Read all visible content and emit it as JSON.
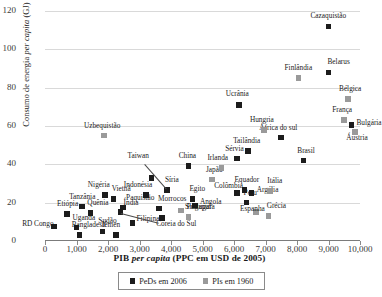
{
  "chart_data": {
    "type": "scatter",
    "title": "",
    "xlabel": "PIB per capita (PPC em USD de 2005)",
    "xlabel_parts": {
      "pre": "PIB ",
      "italic": "per capita",
      "post": " (PPC em USD de 2005)"
    },
    "ylabel": "Consumo de energia per capita (GJ)",
    "ylabel_parts": {
      "pre": "Consumo de energia ",
      "italic": "per capita",
      "post": " (GJ)"
    },
    "xlim": [
      0,
      10000
    ],
    "ylim": [
      0,
      120
    ],
    "xticks": [
      "0",
      "1,000",
      "2,000",
      "3,000",
      "4,000",
      "5,000",
      "6,000",
      "7,000",
      "8,000",
      "9,000",
      "10,000"
    ],
    "xtick_values": [
      0,
      1000,
      2000,
      3000,
      4000,
      5000,
      6000,
      7000,
      8000,
      9000,
      10000
    ],
    "yticks": [
      "0",
      "20",
      "40",
      "60",
      "80",
      "100",
      "120"
    ],
    "ytick_values": [
      0,
      20,
      40,
      60,
      80,
      100,
      120
    ],
    "grid": "horizontal",
    "legend_position": "bottom",
    "series": [
      {
        "name": "PeDs em 2006",
        "color": "#1c1c1c",
        "marker": "square",
        "points": [
          {
            "label": "RD Congo",
            "x": 290,
            "y": 7.5,
            "lx": -32,
            "ly": -3
          },
          {
            "label": "Etiópia",
            "x": 700,
            "y": 14.0,
            "lx": -10,
            "ly": -10
          },
          {
            "label": "Uganda",
            "x": 1000,
            "y": 7.0,
            "lx": -4,
            "ly": -10
          },
          {
            "label": "Bangladesh",
            "x": 1100,
            "y": 3.0,
            "lx": -8,
            "ly": -10
          },
          {
            "label": "Tanzânia",
            "x": 1180,
            "y": 18.0,
            "lx": -13,
            "ly": -10
          },
          {
            "label": "Quênia",
            "x": 1440,
            "y": 14.5,
            "lx": -3,
            "ly": -10
          },
          {
            "label": "Sudão",
            "x": 1820,
            "y": 5.0,
            "lx": -4,
            "ly": -10
          },
          {
            "label": "Nigéria",
            "x": 1900,
            "y": 24.0,
            "lx": -17,
            "ly": -10
          },
          {
            "label": "Vietnã",
            "x": 2180,
            "y": 22.0,
            "lx": -2,
            "ly": -10
          },
          {
            "label": "Iêmen",
            "x": 2250,
            "y": 3.0,
            "lx": -14,
            "ly": -10
          },
          {
            "label": "Índia",
            "x": 2400,
            "y": 15.0,
            "lx": 3,
            "ly": -9
          },
          {
            "label": "Paquistão",
            "x": 2480,
            "y": 17.5,
            "lx": 3,
            "ly": -9
          },
          {
            "label": "Filipinas",
            "x": 2780,
            "y": 9.5,
            "lx": 4,
            "ly": -4
          },
          {
            "label": "Indonésia",
            "x": 3200,
            "y": 24.0,
            "lx": -22,
            "ly": -10
          },
          {
            "label": "Taiwan",
            "x": 3380,
            "y": 33.0,
            "lx": -24,
            "ly": -22
          },
          {
            "label": "Morrocos",
            "x": 3620,
            "y": 17.0,
            "lx": -1,
            "ly": -9
          },
          {
            "label": "Coreia do Sul",
            "x": 3720,
            "y": 12.0,
            "lx": -6,
            "ly": 6
          },
          {
            "label": "Síria",
            "x": 3870,
            "y": 26.5,
            "lx": -2,
            "ly": -10
          },
          {
            "label": "China",
            "x": 4560,
            "y": 39.0,
            "lx": -10,
            "ly": -10
          },
          {
            "label": "Egito",
            "x": 4680,
            "y": 22.0,
            "lx": -3,
            "ly": -10
          },
          {
            "label": "Angola",
            "x": 4760,
            "y": 18.5,
            "lx": 5,
            "ly": -4
          },
          {
            "label": "Tailândia",
            "x": 6450,
            "y": 47.0,
            "lx": -15,
            "ly": -10
          },
          {
            "label": "Sérvia",
            "x": 6100,
            "y": 43.0,
            "lx": -12,
            "ly": -10
          },
          {
            "label": "Colômbia",
            "x": 6100,
            "y": 25.0,
            "lx": -23,
            "ly": -7
          },
          {
            "label": "Equador",
            "x": 6330,
            "y": 26.5,
            "lx": -10,
            "ly": -10
          },
          {
            "label": "Argélia",
            "x": 6560,
            "y": 25.0,
            "lx": 5,
            "ly": -3
          },
          {
            "label": "Peru",
            "x": 6400,
            "y": 20.0,
            "lx": -3,
            "ly": -10
          },
          {
            "label": "Ucrânia",
            "x": 6150,
            "y": 71.0,
            "lx": -13,
            "ly": -11
          },
          {
            "label": "África do sul",
            "x": 7500,
            "y": 54.0,
            "lx": -22,
            "ly": -10
          },
          {
            "label": "Brasil",
            "x": 8200,
            "y": 42.0,
            "lx": -6,
            "ly": -10
          },
          {
            "label": "Belarus",
            "x": 9000,
            "y": 88.0,
            "lx": -1,
            "ly": -10
          },
          {
            "label": "Cazaquistão",
            "x": 9000,
            "y": 112.0,
            "lx": -18,
            "ly": -10
          },
          {
            "label": "Bulgária",
            "x": 9730,
            "y": 60.5,
            "lx": 5,
            "ly": -2
          }
        ]
      },
      {
        "name": "PIs em 1960",
        "color": "#9a9a9a",
        "marker": "square",
        "points": [
          {
            "label": "Uzbequistão",
            "x": 1870,
            "y": 55.0,
            "lx": -20,
            "ly": -10
          },
          {
            "label": "Singapura",
            "x": 4320,
            "y": 16.0,
            "lx": 4,
            "ly": -3
          },
          {
            "label": "Portugal",
            "x": 4560,
            "y": 12.5,
            "lx": -2,
            "ly": -10
          },
          {
            "label": "Japão",
            "x": 5300,
            "y": 32.0,
            "lx": -6,
            "ly": -10
          },
          {
            "label": "Irlanda",
            "x": 5600,
            "y": 38.0,
            "lx": -14,
            "ly": -10
          },
          {
            "label": "Espanha",
            "x": 6700,
            "y": 15.0,
            "lx": -16,
            "ly": -3
          },
          {
            "label": "Grécia",
            "x": 7100,
            "y": 13.0,
            "lx": -2,
            "ly": -10
          },
          {
            "label": "Itália",
            "x": 7150,
            "y": 26.0,
            "lx": -3,
            "ly": -10
          },
          {
            "label": "Hungria",
            "x": 6950,
            "y": 58.0,
            "lx": -14,
            "ly": -10
          },
          {
            "label": "Finlândia",
            "x": 8050,
            "y": 85.0,
            "lx": -14,
            "ly": -10
          },
          {
            "label": "França",
            "x": 9500,
            "y": 63.0,
            "lx": -12,
            "ly": -10
          },
          {
            "label": "Áustria",
            "x": 9850,
            "y": 57.0,
            "lx": -9,
            "ly": 6
          },
          {
            "label": "Bélgica",
            "x": 9620,
            "y": 74.0,
            "lx": -9,
            "ly": -10
          }
        ]
      }
    ]
  }
}
